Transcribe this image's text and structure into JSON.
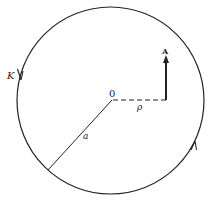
{
  "diagram": {
    "labels": {
      "contour": "K",
      "origin": "0",
      "radius": "a",
      "distance": "ρ",
      "vector": "A"
    },
    "colors": {
      "stroke": "#222222",
      "background": "#ffffff"
    }
  }
}
